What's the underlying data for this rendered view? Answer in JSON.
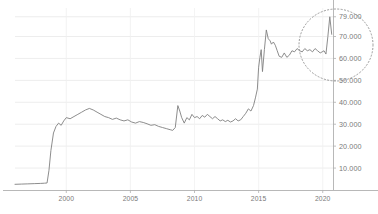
{
  "chart_data": {
    "type": "line",
    "title": "",
    "subtitle": "",
    "xlabel": "",
    "ylabel": "",
    "grid": true,
    "legend": null,
    "xlim": [
      1996.0,
      2020.8
    ],
    "ylim": [
      0,
      83000
    ],
    "xticks": [
      "2000",
      "2005",
      "2010",
      "2015",
      "2020"
    ],
    "xtick_values": [
      2000,
      2005,
      2010,
      2015,
      2020
    ],
    "yticks": [
      "10.000",
      "20.000",
      "30.000",
      "40.000",
      "50.000",
      "60.000",
      "70.000",
      "79.000"
    ],
    "ytick_values": [
      10000,
      20000,
      30000,
      40000,
      50000,
      60000,
      70000,
      79000
    ],
    "yaxis_position": "right",
    "line_color": "#808080",
    "grid_color": "#e8e8e8",
    "axis_color": "#b0b0b0",
    "tick_text_color": "#7a7a7a",
    "series": [
      {
        "name": "value",
        "x": [
          1996.0,
          1996.5,
          1997.0,
          1997.5,
          1998.0,
          1998.3,
          1998.5,
          1998.65,
          1998.8,
          1999.0,
          1999.2,
          1999.4,
          1999.6,
          1999.8,
          2000.0,
          2000.3,
          2000.6,
          2000.9,
          2001.2,
          2001.5,
          2001.8,
          2002.1,
          2002.4,
          2002.7,
          2003.0,
          2003.3,
          2003.6,
          2003.9,
          2004.2,
          2004.5,
          2004.8,
          2005.1,
          2005.4,
          2005.7,
          2006.0,
          2006.3,
          2006.6,
          2006.9,
          2007.2,
          2007.5,
          2007.8,
          2008.1,
          2008.3,
          2008.5,
          2008.7,
          2008.85,
          2009.0,
          2009.2,
          2009.4,
          2009.6,
          2009.8,
          2010.0,
          2010.2,
          2010.4,
          2010.6,
          2010.8,
          2011.0,
          2011.2,
          2011.4,
          2011.6,
          2011.8,
          2012.0,
          2012.2,
          2012.4,
          2012.6,
          2012.8,
          2013.0,
          2013.2,
          2013.4,
          2013.6,
          2013.8,
          2014.0,
          2014.2,
          2014.4,
          2014.6,
          2014.75,
          2014.9,
          2015.0,
          2015.1,
          2015.2,
          2015.3,
          2015.45,
          2015.6,
          2015.75,
          2015.9,
          2016.0,
          2016.15,
          2016.3,
          2016.45,
          2016.6,
          2016.8,
          2017.0,
          2017.2,
          2017.4,
          2017.6,
          2017.8,
          2018.0,
          2018.2,
          2018.4,
          2018.6,
          2018.8,
          2019.0,
          2019.2,
          2019.4,
          2019.6,
          2019.8,
          2019.95,
          2020.1,
          2020.25,
          2020.4,
          2020.55,
          2020.7
        ],
        "y": [
          2600,
          2700,
          2800,
          2900,
          3000,
          3100,
          3200,
          9000,
          18000,
          26000,
          29000,
          30500,
          29500,
          31500,
          33000,
          32500,
          33500,
          34500,
          35500,
          36500,
          37200,
          36500,
          35500,
          34500,
          33500,
          33000,
          32200,
          32800,
          32000,
          31500,
          32000,
          31000,
          30500,
          31200,
          30800,
          30200,
          29500,
          29800,
          29000,
          28500,
          28000,
          27500,
          27200,
          28500,
          38500,
          36000,
          33000,
          30500,
          33000,
          32000,
          34500,
          33000,
          33500,
          32500,
          34000,
          33200,
          34500,
          33500,
          32500,
          33500,
          32500,
          31500,
          32000,
          31200,
          31800,
          31000,
          31500,
          32500,
          31500,
          32000,
          33500,
          35000,
          37000,
          36000,
          38500,
          42000,
          46000,
          56000,
          60500,
          64000,
          54000,
          64000,
          73000,
          69000,
          68000,
          66500,
          67500,
          66000,
          63500,
          61000,
          60500,
          62500,
          60500,
          61500,
          63500,
          63000,
          64500,
          63500,
          63000,
          64500,
          63500,
          64000,
          63000,
          64500,
          63500,
          62500,
          63000,
          63500,
          62000,
          70000,
          79000,
          71000
        ]
      }
    ],
    "annotations": [
      {
        "type": "ellipse-highlight",
        "style": "dotted",
        "color": "#9a9a9a",
        "cx_px": 336,
        "cy_px": 45,
        "rx_px": 37,
        "ry_px": 36,
        "label": "recent-spike-highlight"
      }
    ]
  }
}
